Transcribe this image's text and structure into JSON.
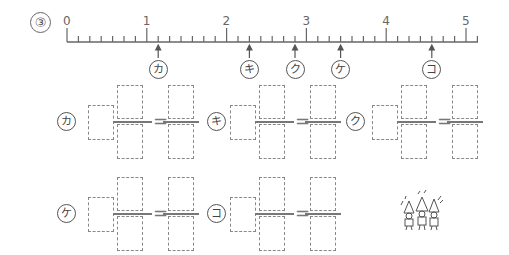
{
  "problem": {
    "number_label": "③",
    "number_line": {
      "start": 0,
      "end": 5,
      "divisions_per_unit": 7,
      "major_labels": [
        "0",
        "1",
        "2",
        "3",
        "4",
        "5"
      ],
      "markers": [
        {
          "label": "カ",
          "value": "1 1/7"
        },
        {
          "label": "キ",
          "value": "2 2/7"
        },
        {
          "label": "ク",
          "value": "2 6/7"
        },
        {
          "label": "ケ",
          "value": "3 3/7"
        },
        {
          "label": "コ",
          "value": "4 4/7"
        }
      ]
    },
    "answers": [
      {
        "label": "カ",
        "whole": "",
        "numerator": "",
        "denominator": "",
        "improper_numerator": "",
        "improper_denominator": "",
        "equals": "="
      },
      {
        "label": "キ",
        "whole": "",
        "numerator": "",
        "denominator": "",
        "improper_numerator": "",
        "improper_denominator": "",
        "equals": "="
      },
      {
        "label": "ク",
        "whole": "",
        "numerator": "",
        "denominator": "",
        "improper_numerator": "",
        "improper_denominator": "",
        "equals": "="
      },
      {
        "label": "ケ",
        "whole": "",
        "numerator": "",
        "denominator": "",
        "improper_numerator": "",
        "improper_denominator": "",
        "equals": "="
      },
      {
        "label": "コ",
        "whole": "",
        "numerator": "",
        "denominator": "",
        "improper_numerator": "",
        "improper_denominator": "",
        "equals": "="
      }
    ],
    "illustration": "cheering-gnomes-icon"
  }
}
